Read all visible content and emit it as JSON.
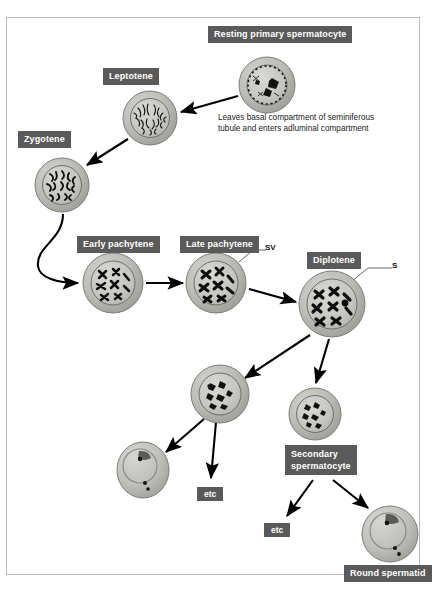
{
  "figure": {
    "background_color": "#ffffff",
    "frame_color": "#b9b9b9",
    "label_box_color": "#5a5a5a",
    "label_text_color": "#ffffff",
    "cell_cytoplasm_color": "#b5b5b0",
    "cell_nucleus_color": "#c9c9c4",
    "chromatin_color": "#111111",
    "arrow_color": "#000000"
  },
  "labels": {
    "resting_primary_spermatocyte": "Resting primary spermatocyte",
    "leptotene": "Leptotene",
    "zygotene": "Zygotene",
    "early_pachytene": "Early pachytene",
    "late_pachytene": "Late pachytene",
    "diplotene": "Diplotene",
    "secondary_spermatocyte": "Secondary\nspermatocyte",
    "secondary_spermatocyte_line1": "Secondary",
    "secondary_spermatocyte_line2": "spermatocyte",
    "round_spermatid": "Round spermatid",
    "etc_left": "etc",
    "etc_right": "etc"
  },
  "annotations": {
    "sv": "SV",
    "s": "S",
    "note": "Leaves basal compartment of seminiferous tubule and enters adluminal compartment"
  },
  "cells": [
    {
      "name": "resting-primary-spermatocyte",
      "stage": "Resting primary spermatocyte",
      "cx": 267,
      "cy": 85,
      "r": 28
    },
    {
      "name": "leptotene",
      "stage": "Leptotene",
      "cx": 150,
      "cy": 118,
      "r": 27
    },
    {
      "name": "zygotene",
      "stage": "Zygotene",
      "cx": 62,
      "cy": 185,
      "r": 27
    },
    {
      "name": "early-pachytene",
      "stage": "Early pachytene",
      "cx": 113,
      "cy": 283,
      "r": 30
    },
    {
      "name": "late-pachytene",
      "stage": "Late pachytene",
      "cx": 216,
      "cy": 283,
      "r": 30
    },
    {
      "name": "diplotene",
      "stage": "Diplotene",
      "cx": 332,
      "cy": 304,
      "r": 33
    },
    {
      "name": "daughter-cell-left",
      "stage": "Meiosis I daughter",
      "cx": 220,
      "cy": 394,
      "r": 29
    },
    {
      "name": "secondary-spermatocyte",
      "stage": "Secondary spermatocyte",
      "cx": 315,
      "cy": 414,
      "r": 26
    },
    {
      "name": "spermatid-left",
      "stage": "Round spermatid",
      "cx": 143,
      "cy": 470,
      "r": 26
    },
    {
      "name": "spermatid-right",
      "stage": "Round spermatid",
      "cx": 390,
      "cy": 534,
      "r": 28
    }
  ],
  "flow": [
    {
      "from": "resting-primary-spermatocyte",
      "to": "leptotene"
    },
    {
      "from": "leptotene",
      "to": "zygotene"
    },
    {
      "from": "zygotene",
      "to": "early-pachytene"
    },
    {
      "from": "early-pachytene",
      "to": "late-pachytene"
    },
    {
      "from": "late-pachytene",
      "to": "diplotene"
    },
    {
      "from": "diplotene",
      "to": "daughter-cell-left"
    },
    {
      "from": "diplotene",
      "to": "secondary-spermatocyte"
    },
    {
      "from": "daughter-cell-left",
      "to": "spermatid-left"
    },
    {
      "from": "daughter-cell-left",
      "to": "etc-left"
    },
    {
      "from": "secondary-spermatocyte",
      "to": "etc-right"
    },
    {
      "from": "secondary-spermatocyte",
      "to": "spermatid-right"
    }
  ]
}
